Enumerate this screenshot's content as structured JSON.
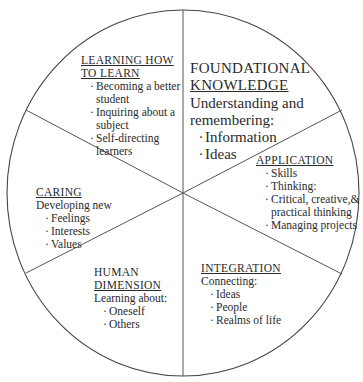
{
  "diagram": {
    "type": "wheel",
    "segments": 6,
    "stroke_color": "#444444",
    "background": "#ffffff"
  },
  "foundational": {
    "title_line1": "FOUNDATIONAL",
    "title_line2": "KNOWLEDGE",
    "subtitle_line1": "Understanding and",
    "subtitle_line2": "remembering:",
    "items": [
      "Information",
      "Ideas"
    ]
  },
  "application": {
    "title": "APPLICATION",
    "items": [
      "Skills",
      "Thinking:",
      "Critical, creative,&",
      "Managing projects"
    ],
    "item3_wrap": "practical thinking"
  },
  "integration": {
    "title": "INTEGRATION",
    "subtitle": "Connecting:",
    "items": [
      "Ideas",
      "People",
      "Realms of life"
    ]
  },
  "human": {
    "title_line1": "HUMAN",
    "title_line2": "DIMENSION",
    "subtitle": "Learning about:",
    "items": [
      "Oneself",
      "Others"
    ]
  },
  "caring": {
    "title": "CARING",
    "subtitle": "Developing new",
    "items": [
      "Feelings",
      "Interests",
      "Values"
    ]
  },
  "learning": {
    "title_line1": "LEARNING HOW",
    "title_line2": "TO LEARN",
    "items": [
      "Becoming a better",
      "Inquiring about a",
      "Self-directing"
    ],
    "wraps": [
      "student",
      "subject",
      "learners"
    ]
  },
  "bullet": "·"
}
